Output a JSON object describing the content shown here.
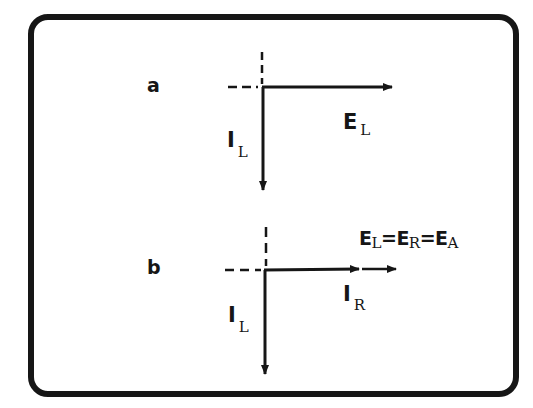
{
  "figure": {
    "border_color": "#161616",
    "background": "#ffffff",
    "panels": [
      {
        "id": "a",
        "label": "a",
        "vectors": [
          {
            "name": "E",
            "subscript": "L",
            "direction": "right"
          },
          {
            "name": "I",
            "subscript": "L",
            "direction": "down"
          }
        ],
        "E_label": {
          "main": "E",
          "sub": "L"
        },
        "I_label": {
          "main": "I",
          "sub": "L"
        }
      },
      {
        "id": "b",
        "label": "b",
        "vectors": [
          {
            "name": "I",
            "subscript": "R",
            "direction": "right"
          },
          {
            "name": "E",
            "subscript": "A",
            "direction": "right"
          },
          {
            "name": "I",
            "subscript": "L",
            "direction": "down"
          }
        ],
        "IR_label": {
          "main": "I",
          "sub": "R"
        },
        "I_label": {
          "main": "I",
          "sub": "L"
        },
        "equation": {
          "e1": "E",
          "s1": "L",
          "eq1": "=",
          "e2": "E",
          "s2": "R",
          "eq2": "=",
          "e3": "E",
          "s3": "A"
        }
      }
    ]
  }
}
